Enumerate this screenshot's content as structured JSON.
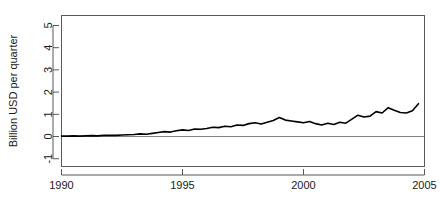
{
  "chart_data": {
    "type": "line",
    "title": "",
    "subtitle": "",
    "xlabel": "",
    "ylabel": "Billion USD per quarter",
    "xlim": [
      1990.0,
      2005.0
    ],
    "ylim": [
      -1.35,
      5.45
    ],
    "xticks": [
      1990,
      1995,
      2000,
      2005
    ],
    "xtick_labels": [
      "1990",
      "1995",
      "2000",
      "2005"
    ],
    "yticks": [
      -1,
      0,
      1,
      2,
      3,
      4,
      5
    ],
    "ytick_labels": [
      "-1",
      "0",
      "1",
      "2",
      "3",
      "4",
      "5"
    ],
    "grid": false,
    "legend": null,
    "box": true,
    "reference_lines": [
      {
        "orientation": "horizontal",
        "value": 0,
        "color": "#808080",
        "width": 1
      }
    ],
    "series": [
      {
        "name": "Billion USD per quarter",
        "color": "#000000",
        "line_width": 1.6,
        "x": [
          1990.0,
          1990.25,
          1990.5,
          1990.75,
          1991.0,
          1991.25,
          1991.5,
          1991.75,
          1992.0,
          1992.25,
          1992.5,
          1992.75,
          1993.0,
          1993.25,
          1993.5,
          1993.75,
          1994.0,
          1994.25,
          1994.5,
          1994.75,
          1995.0,
          1995.25,
          1995.5,
          1995.75,
          1996.0,
          1996.25,
          1996.5,
          1996.75,
          1997.0,
          1997.25,
          1997.5,
          1997.75,
          1998.0,
          1998.25,
          1998.5,
          1998.75,
          1999.0,
          1999.25,
          1999.5,
          1999.75,
          2000.0,
          2000.25,
          2000.5,
          2000.75,
          2001.0,
          2001.25,
          2001.5,
          2001.75,
          2002.0,
          2002.25,
          2002.5,
          2002.75,
          2003.0,
          2003.25,
          2003.5,
          2003.75,
          2004.0,
          2004.25,
          2004.5,
          2004.75
        ],
        "values": [
          0.02,
          0.02,
          0.03,
          0.02,
          0.03,
          0.04,
          0.03,
          0.05,
          0.06,
          0.05,
          0.07,
          0.08,
          0.09,
          0.12,
          0.1,
          0.14,
          0.18,
          0.22,
          0.2,
          0.26,
          0.3,
          0.27,
          0.34,
          0.33,
          0.36,
          0.42,
          0.4,
          0.46,
          0.44,
          0.52,
          0.5,
          0.58,
          0.62,
          0.56,
          0.64,
          0.72,
          0.86,
          0.74,
          0.7,
          0.66,
          0.62,
          0.68,
          0.58,
          0.52,
          0.6,
          0.54,
          0.64,
          0.6,
          0.78,
          0.96,
          0.88,
          0.92,
          1.12,
          1.06,
          1.3,
          1.18,
          1.08,
          1.06,
          1.16,
          1.48
        ]
      }
    ]
  }
}
